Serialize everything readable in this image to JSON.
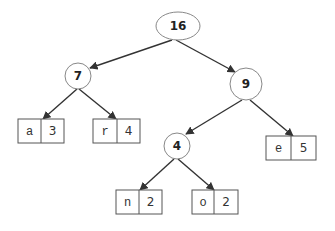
{
  "colors": {
    "edge": "#333333",
    "node_stroke": "#888888",
    "box_stroke": "#555555",
    "text": "#222222"
  },
  "tree": {
    "root": {
      "label": "16",
      "cx": 178,
      "cy": 26
    },
    "internal": [
      {
        "id": "n7",
        "label": "7",
        "cx": 78,
        "cy": 76
      },
      {
        "id": "n9",
        "label": "9",
        "cx": 246,
        "cy": 84
      },
      {
        "id": "n4",
        "label": "4",
        "cx": 177,
        "cy": 146
      }
    ],
    "leaves": [
      {
        "id": "leaf-a",
        "char": "a",
        "freq": "3",
        "x": 18,
        "y": 119
      },
      {
        "id": "leaf-r",
        "char": "r",
        "freq": "4",
        "x": 93,
        "y": 119
      },
      {
        "id": "leaf-e",
        "char": "e",
        "freq": "5",
        "x": 268,
        "y": 136
      },
      {
        "id": "leaf-n",
        "char": "n",
        "freq": "2",
        "x": 116,
        "y": 190
      },
      {
        "id": "leaf-o",
        "char": "o",
        "freq": "2",
        "x": 192,
        "y": 190
      }
    ],
    "edges": [
      {
        "from": "16",
        "to": "7"
      },
      {
        "from": "16",
        "to": "9"
      },
      {
        "from": "7",
        "to": "a"
      },
      {
        "from": "7",
        "to": "r"
      },
      {
        "from": "9",
        "to": "4"
      },
      {
        "from": "9",
        "to": "e"
      },
      {
        "from": "4",
        "to": "n"
      },
      {
        "from": "4",
        "to": "o"
      }
    ]
  }
}
